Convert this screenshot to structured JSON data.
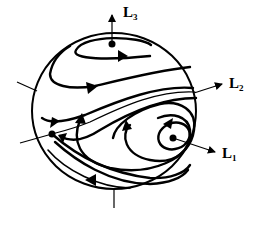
{
  "diagram": {
    "type": "phase-portrait-on-sphere",
    "stroke_color": "#000000",
    "background": "#ffffff",
    "labels": [
      {
        "id": "L3",
        "main": "L",
        "sub": "3",
        "x": 123,
        "y": 4
      },
      {
        "id": "L2",
        "main": "L",
        "sub": "2",
        "x": 229,
        "y": 76
      },
      {
        "id": "L1",
        "main": "L",
        "sub": "1",
        "x": 222,
        "y": 146
      }
    ],
    "equilibria": [
      {
        "name": "top-center",
        "x": 112,
        "y": 44,
        "axis": "L3"
      },
      {
        "name": "left-saddle",
        "x": 52,
        "y": 134
      },
      {
        "name": "right-center",
        "x": 173,
        "y": 138,
        "axis": "L1"
      }
    ],
    "axes": [
      {
        "name": "L3",
        "from": [
          112,
          44
        ],
        "to": [
          112,
          15
        ],
        "arrow": true
      },
      {
        "name": "L2",
        "from": [
          194,
          93
        ],
        "to": [
          222,
          84
        ],
        "arrow": true
      },
      {
        "name": "L1",
        "from": [
          173,
          138
        ],
        "to": [
          215,
          152
        ],
        "arrow": true
      },
      {
        "name": "L2-negative",
        "from": [
          35,
          90
        ],
        "to": [
          17,
          82
        ],
        "arrow": false
      },
      {
        "name": "left-line",
        "from": [
          52,
          134
        ],
        "to": [
          22,
          142
        ],
        "arrow": false
      },
      {
        "name": "bottom-stub",
        "from": [
          114,
          188
        ],
        "to": [
          114,
          207
        ],
        "arrow": false
      }
    ]
  }
}
